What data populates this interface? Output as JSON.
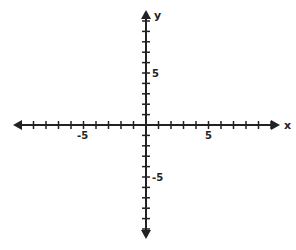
{
  "diagram": {
    "type": "coordinate-plane",
    "axes": {
      "x_label": "x",
      "y_label": "y",
      "x_range": [
        -10,
        10
      ],
      "y_range": [
        -10,
        10
      ],
      "tick_step": 1
    },
    "tick_labels": {
      "x_neg": "-5",
      "x_pos": "5",
      "y_pos": "5",
      "y_neg": "-5"
    },
    "colors": {
      "axis": "#222222",
      "background": "#ffffff"
    }
  }
}
